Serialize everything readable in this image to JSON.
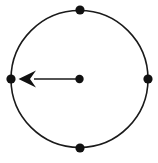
{
  "figure": {
    "canvas": {
      "width": 158,
      "height": 163,
      "background": "#ffffff"
    },
    "stroke_color": "#1a1a1a",
    "fill_color": "#111111",
    "circle": {
      "label": "circle-outline",
      "cx": 79.5,
      "cy": 79,
      "r": 68.5,
      "stroke_width": 1.6,
      "fill": "none"
    },
    "points": [
      {
        "name": "top-point",
        "label": "top",
        "cx": 80,
        "cy": 10,
        "r": 4.6
      },
      {
        "name": "right-point",
        "label": "right",
        "cx": 148,
        "cy": 79,
        "r": 4.6
      },
      {
        "name": "bottom-point",
        "label": "bottom",
        "cx": 80,
        "cy": 148,
        "r": 4.6
      },
      {
        "name": "left-point",
        "label": "left",
        "cx": 11,
        "cy": 79,
        "r": 4.6
      },
      {
        "name": "center-point",
        "label": "centre",
        "cx": 79.5,
        "cy": 79,
        "r": 4.2
      }
    ],
    "arrow": {
      "name": "radius-arrow",
      "direction": "left",
      "shaft": {
        "x1": 79.5,
        "y1": 79,
        "x2": 34,
        "y2": 79,
        "width": 1.7
      },
      "head": {
        "tip_x": 18.5,
        "tip_y": 79,
        "back_x": 36,
        "half_height": 8.5,
        "notch_x": 30
      }
    }
  }
}
